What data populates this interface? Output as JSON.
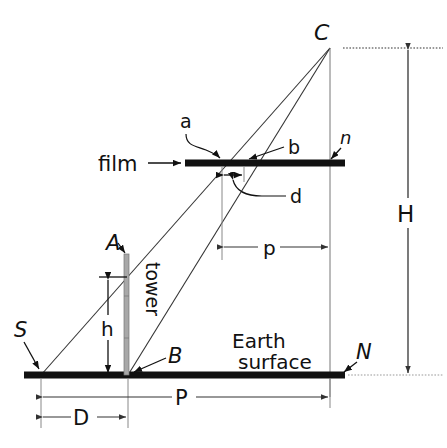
{
  "figure": {
    "background_color": "#ffffff",
    "ink_color": "#111111",
    "tower_color": "#9a9a9a",
    "thin_line_color": "#555555"
  },
  "labels": {
    "camera_station": "C",
    "film": "film",
    "image_point_a": "a",
    "image_point_b": "b",
    "nadir_image": "n",
    "image_displacement": "d",
    "radial_distance_image": "p",
    "tower_top": "A",
    "tower_base": "B",
    "tower": "tower",
    "tower_height": "h",
    "ground_principal_point": "S",
    "ground_nadir": "N",
    "earth_surface_line1": "Earth",
    "earth_surface_line2": "surface",
    "flying_height": "H",
    "radial_distance_ground": "P",
    "ground_displacement": "D"
  },
  "geometry": {
    "camera": {
      "x": 330,
      "y": 48
    },
    "film": {
      "x1": 185,
      "x2": 345,
      "y": 163,
      "thickness": 7
    },
    "earth": {
      "x1": 24,
      "x2": 345,
      "y": 375,
      "thickness": 7
    },
    "point_a_on_film": {
      "x": 222,
      "y": 163
    },
    "point_b_on_film": {
      "x": 244,
      "y": 163
    },
    "point_n_on_film": {
      "x": 330,
      "y": 163
    },
    "point_S": {
      "x": 41,
      "y": 375
    },
    "point_B": {
      "x": 128,
      "y": 375
    },
    "point_N": {
      "x": 330,
      "y": 375
    },
    "tower": {
      "x": 126,
      "top_y": 254,
      "base_y": 375,
      "width": 5
    },
    "dim_h": {
      "x": 108,
      "y1": 278,
      "y2": 375
    },
    "dim_p": {
      "y": 247,
      "x1": 224,
      "x2": 330
    },
    "dim_P": {
      "y": 397,
      "x1": 41,
      "x2": 330
    },
    "dim_D": {
      "y": 417,
      "x1": 41,
      "x2": 128
    },
    "dim_H": {
      "x": 408,
      "y1": 48,
      "y2": 375,
      "label_gap_y1": 198,
      "label_gap_y2": 228
    },
    "dim_d": {
      "y": 176,
      "x1": 222,
      "x2": 244
    }
  }
}
